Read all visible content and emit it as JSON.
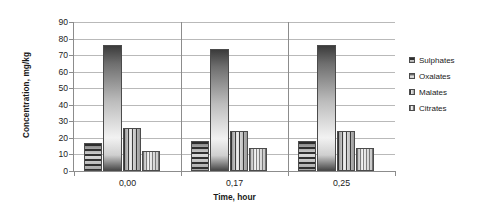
{
  "chart_data": {
    "type": "bar",
    "title": "",
    "xlabel": "Time, hour",
    "ylabel": "Concentration, mg/kg",
    "categories": [
      "0,00",
      "0,17",
      "0,25"
    ],
    "series": [
      {
        "name": "Sulphates",
        "values": [
          17,
          18,
          18
        ]
      },
      {
        "name": "Oxalates",
        "values": [
          76,
          74,
          76
        ]
      },
      {
        "name": "Malates",
        "values": [
          26,
          24,
          24
        ]
      },
      {
        "name": "Citrates",
        "values": [
          12,
          14,
          14
        ]
      }
    ],
    "ylim": [
      0,
      90
    ],
    "ytick_step": 10,
    "yticks": [
      "90",
      "80",
      "70",
      "60",
      "50",
      "40",
      "30",
      "20",
      "10",
      "0"
    ],
    "grid": true,
    "legend_position": "right"
  },
  "legend": {
    "items": [
      {
        "label": "Sulphates",
        "swatch": "sulphates-swatch-icon"
      },
      {
        "label": "Oxalates",
        "swatch": "oxalates-swatch-icon"
      },
      {
        "label": "Malates",
        "swatch": "malates-swatch-icon"
      },
      {
        "label": "Citrates",
        "swatch": "citrates-swatch-icon"
      }
    ]
  },
  "colors": {
    "gridline": "#b9b9b9",
    "axis": "#8c8c8c",
    "text": "#1a1a1a",
    "background": "#ffffff"
  }
}
